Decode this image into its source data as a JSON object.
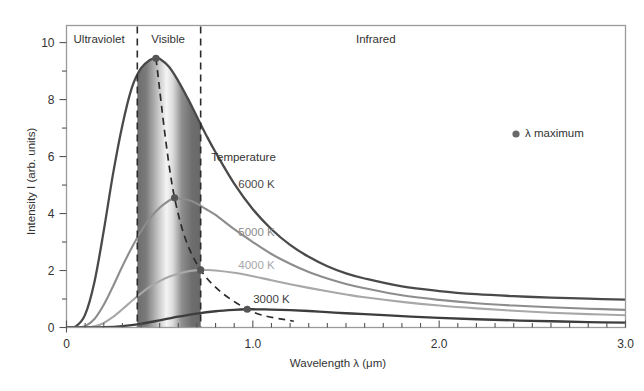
{
  "chart_data": {
    "type": "line",
    "title": "",
    "xlabel": "Wavelength λ (μm)",
    "ylabel": "Intensity I (arb. units)",
    "xlim": [
      0,
      3.0
    ],
    "ylim": [
      0,
      10.6
    ],
    "xticks": [
      0,
      1.0,
      2.0,
      3.0
    ],
    "xtick_labels": [
      "0",
      "1.0",
      "2.0",
      "3.0"
    ],
    "xminor_step": 0.1,
    "yticks": [
      0,
      2,
      4,
      6,
      8,
      10
    ],
    "ytick_labels": [
      "0",
      "2",
      "4",
      "6",
      "8",
      "10"
    ],
    "yminor_step": 1,
    "grid": false,
    "legend_position": "upper-right-inside",
    "series": [
      {
        "name": "6000 K",
        "temperature_K": 6000,
        "color": "#4a4a4a",
        "label_x": 1.02,
        "label_y": 5.0,
        "peak": {
          "x": 0.48,
          "y": 9.45
        },
        "points_x": [
          0.0,
          0.05,
          0.1,
          0.15,
          0.2,
          0.25,
          0.3,
          0.35,
          0.4,
          0.45,
          0.48,
          0.5,
          0.55,
          0.6,
          0.65,
          0.7,
          0.75,
          0.8,
          0.9,
          1.0,
          1.1,
          1.2,
          1.3,
          1.4,
          1.5,
          1.6,
          1.8,
          2.0,
          2.2,
          2.4,
          2.6,
          2.8,
          3.0
        ],
        "points_y": [
          0.0,
          0.04,
          0.45,
          1.6,
          3.4,
          5.4,
          7.1,
          8.4,
          9.1,
          9.4,
          9.45,
          9.43,
          9.15,
          8.65,
          8.05,
          7.4,
          6.75,
          6.15,
          5.05,
          4.15,
          3.45,
          2.9,
          2.48,
          2.15,
          1.9,
          1.72,
          1.44,
          1.28,
          1.17,
          1.1,
          1.05,
          1.01,
          0.98
        ]
      },
      {
        "name": "5000 K",
        "temperature_K": 5000,
        "color": "#8d8d8d",
        "label_x": 1.02,
        "label_y": 3.3,
        "peak": {
          "x": 0.58,
          "y": 4.55
        },
        "points_x": [
          0.0,
          0.05,
          0.1,
          0.15,
          0.2,
          0.25,
          0.3,
          0.35,
          0.4,
          0.45,
          0.5,
          0.55,
          0.58,
          0.6,
          0.65,
          0.7,
          0.75,
          0.8,
          0.9,
          1.0,
          1.1,
          1.2,
          1.3,
          1.4,
          1.5,
          1.6,
          1.8,
          2.0,
          2.2,
          2.4,
          2.6,
          2.8,
          3.0
        ],
        "points_y": [
          0.0,
          0.0,
          0.05,
          0.3,
          0.8,
          1.45,
          2.15,
          2.8,
          3.38,
          3.85,
          4.2,
          4.45,
          4.55,
          4.53,
          4.48,
          4.35,
          4.15,
          3.95,
          3.45,
          3.0,
          2.58,
          2.24,
          1.95,
          1.72,
          1.53,
          1.38,
          1.13,
          0.97,
          0.85,
          0.77,
          0.71,
          0.66,
          0.62
        ]
      },
      {
        "name": "4000 K",
        "temperature_K": 4000,
        "color": "#a8a8a8",
        "label_x": 1.02,
        "label_y": 2.15,
        "peak": {
          "x": 0.72,
          "y": 2.02
        },
        "points_x": [
          0.0,
          0.05,
          0.1,
          0.15,
          0.2,
          0.25,
          0.3,
          0.35,
          0.4,
          0.45,
          0.5,
          0.55,
          0.6,
          0.65,
          0.7,
          0.72,
          0.75,
          0.8,
          0.9,
          1.0,
          1.1,
          1.2,
          1.3,
          1.4,
          1.5,
          1.6,
          1.8,
          2.0,
          2.2,
          2.4,
          2.6,
          2.8,
          3.0
        ],
        "points_y": [
          0.0,
          0.0,
          0.0,
          0.04,
          0.16,
          0.37,
          0.64,
          0.93,
          1.2,
          1.44,
          1.63,
          1.78,
          1.89,
          1.97,
          2.01,
          2.02,
          2.02,
          2.0,
          1.92,
          1.8,
          1.66,
          1.52,
          1.39,
          1.27,
          1.16,
          1.06,
          0.9,
          0.77,
          0.67,
          0.59,
          0.52,
          0.47,
          0.43
        ]
      },
      {
        "name": "3000 K",
        "temperature_K": 3000,
        "color": "#3d3d3d",
        "label_x": 1.1,
        "label_y": 0.95,
        "peak": {
          "x": 0.97,
          "y": 0.64
        },
        "points_x": [
          0.0,
          0.1,
          0.2,
          0.3,
          0.4,
          0.5,
          0.6,
          0.7,
          0.8,
          0.9,
          0.97,
          1.0,
          1.1,
          1.2,
          1.3,
          1.4,
          1.5,
          1.6,
          1.8,
          2.0,
          2.2,
          2.4,
          2.6,
          2.8,
          3.0
        ],
        "points_y": [
          0.0,
          0.0,
          0.01,
          0.05,
          0.13,
          0.25,
          0.38,
          0.49,
          0.57,
          0.62,
          0.64,
          0.64,
          0.63,
          0.61,
          0.58,
          0.54,
          0.5,
          0.47,
          0.4,
          0.34,
          0.29,
          0.25,
          0.22,
          0.19,
          0.17
        ]
      }
    ],
    "wien_curve": {
      "name": "λ maximum",
      "color": "#2b2b2b",
      "style": "dashed",
      "points_x": [
        0.48,
        0.58,
        0.72,
        0.97,
        1.22
      ],
      "points_y": [
        9.45,
        4.55,
        2.02,
        0.64,
        0.22
      ]
    },
    "markers": [
      {
        "label": "6000 K maximum",
        "x": 0.48,
        "y": 9.45
      },
      {
        "label": "5000 K maximum",
        "x": 0.58,
        "y": 4.55
      },
      {
        "label": "4000 K maximum",
        "x": 0.72,
        "y": 2.02
      },
      {
        "label": "3000 K maximum",
        "x": 0.97,
        "y": 0.64
      }
    ],
    "regions": [
      {
        "label": "Ultraviolet",
        "x_start": 0.0,
        "x_end": 0.38,
        "label_x": 0.175
      },
      {
        "label": "Visible",
        "x_start": 0.38,
        "x_end": 0.72,
        "label_x": 0.545,
        "shaded": true
      },
      {
        "label": "Infrared",
        "x_start": 0.72,
        "x_end": 3.0,
        "label_x": 1.66
      }
    ],
    "region_boundaries": [
      0.38,
      0.72
    ],
    "annotations": [
      {
        "name": "temperature-title",
        "text": "Temperature",
        "x": 0.95,
        "y": 5.95
      }
    ]
  },
  "legend": {
    "marker_label": "λ maximum",
    "marker_color": "#6a6a6a"
  },
  "axes": {
    "x_label": "Wavelength λ (μm)",
    "y_label": "Intensity I (arb. units)"
  },
  "colors": {
    "frame": "#9a9a9a",
    "text": "#333333",
    "visible_band_edge": "#6d6d6d",
    "visible_band_center": "#f2f2f2"
  }
}
